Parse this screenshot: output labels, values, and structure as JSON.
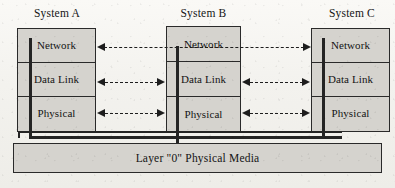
{
  "diagram": {
    "background_color": "#f6f5f2",
    "box_fill_color": "#d5d3ce",
    "line_color": "#242424"
  },
  "systems": [
    {
      "id": "system-a",
      "title": "System A",
      "layers": [
        {
          "id": "network",
          "label": "Network"
        },
        {
          "id": "data-link",
          "label": "Data Link"
        },
        {
          "id": "physical",
          "label": "Physical"
        }
      ]
    },
    {
      "id": "system-b",
      "title": "System B",
      "layers": [
        {
          "id": "network",
          "label": "Network"
        },
        {
          "id": "data-link",
          "label": "Data Link"
        },
        {
          "id": "physical",
          "label": "Physical"
        }
      ]
    },
    {
      "id": "system-c",
      "title": "System C",
      "layers": [
        {
          "id": "network",
          "label": "Network"
        },
        {
          "id": "data-link",
          "label": "Data Link"
        },
        {
          "id": "physical",
          "label": "Physical"
        }
      ]
    }
  ],
  "media": {
    "label": "Layer \"0\" Physical Media"
  },
  "connectors": [
    {
      "id": "network-peer-a-c",
      "layer": "Network",
      "from": "System A",
      "to": "System C",
      "style": "dashed",
      "arrows": "both"
    },
    {
      "id": "datalink-peer-a-b",
      "layer": "Data Link",
      "from": "System A",
      "to": "System B",
      "style": "dashed",
      "arrows": "both"
    },
    {
      "id": "datalink-peer-b-c",
      "layer": "Data Link",
      "from": "System B",
      "to": "System C",
      "style": "dashed",
      "arrows": "both"
    },
    {
      "id": "physical-peer-a-b",
      "layer": "Physical",
      "from": "System A",
      "to": "System B",
      "style": "dashed",
      "arrows": "both"
    },
    {
      "id": "physical-peer-b-c",
      "layer": "Physical",
      "from": "System B",
      "to": "System C",
      "style": "dashed",
      "arrows": "both"
    }
  ]
}
